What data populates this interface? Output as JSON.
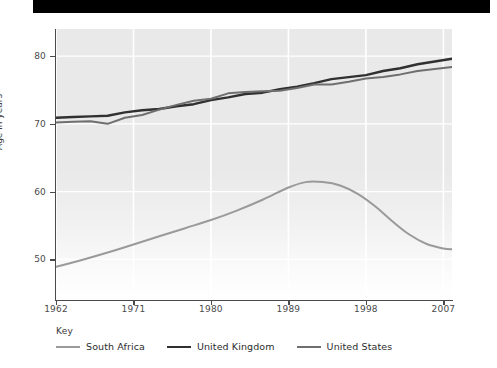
{
  "chart_data": {
    "type": "line",
    "title": "",
    "xlabel": "",
    "ylabel": "Age in years",
    "xlim": [
      1962,
      2008
    ],
    "ylim": [
      44,
      84
    ],
    "xticks": [
      1962,
      1971,
      1980,
      1989,
      1998,
      2007
    ],
    "yticks": [
      50,
      60,
      70,
      80
    ],
    "grid": true,
    "legend_position": "bottom-left",
    "legend_title": "Key",
    "series": [
      {
        "name": "South Africa",
        "color": "#9a9a9a",
        "x": [
          1962,
          1965,
          1968,
          1971,
          1974,
          1977,
          1980,
          1983,
          1986,
          1989,
          1991,
          1993,
          1995,
          1997,
          1999,
          2001,
          2003,
          2005,
          2007,
          2008
        ],
        "values": [
          48.9,
          49.9,
          51.0,
          52.2,
          53.4,
          54.6,
          55.8,
          57.2,
          58.8,
          60.6,
          61.4,
          61.4,
          60.9,
          59.7,
          57.9,
          55.7,
          53.7,
          52.3,
          51.6,
          51.5
        ]
      },
      {
        "name": "United Kingdom",
        "color": "#303030",
        "x": [
          1962,
          1964,
          1966,
          1968,
          1970,
          1972,
          1974,
          1976,
          1978,
          1980,
          1982,
          1984,
          1986,
          1988,
          1990,
          1992,
          1994,
          1996,
          1998,
          2000,
          2002,
          2004,
          2006,
          2008
        ],
        "values": [
          70.9,
          71.0,
          71.1,
          71.2,
          71.7,
          72.0,
          72.2,
          72.6,
          72.9,
          73.5,
          73.9,
          74.4,
          74.6,
          75.1,
          75.5,
          76.0,
          76.6,
          76.9,
          77.2,
          77.8,
          78.2,
          78.8,
          79.2,
          79.6
        ]
      },
      {
        "name": "United States",
        "color": "#6f6f6f",
        "x": [
          1962,
          1964,
          1966,
          1968,
          1970,
          1972,
          1974,
          1976,
          1978,
          1980,
          1982,
          1984,
          1986,
          1988,
          1990,
          1992,
          1994,
          1996,
          1998,
          2000,
          2002,
          2004,
          2006,
          2008
        ],
        "values": [
          70.2,
          70.3,
          70.4,
          70.0,
          70.9,
          71.3,
          72.1,
          72.8,
          73.4,
          73.7,
          74.5,
          74.7,
          74.8,
          74.9,
          75.3,
          75.8,
          75.8,
          76.2,
          76.7,
          76.9,
          77.3,
          77.8,
          78.1,
          78.4
        ]
      }
    ]
  },
  "axes": {
    "ylabel_text": "Age in years",
    "ytick_labels": [
      "50",
      "60",
      "70",
      "80"
    ],
    "xtick_labels": [
      "1962",
      "1971",
      "1980",
      "1989",
      "1998",
      "2007"
    ]
  },
  "legend": {
    "title": "Key",
    "entries": [
      {
        "label": "South Africa",
        "color": "#9a9a9a",
        "width": "2.2px"
      },
      {
        "label": "United Kingdom",
        "color": "#303030",
        "width": "2.6px"
      },
      {
        "label": "United States",
        "color": "#6f6f6f",
        "width": "2.4px"
      }
    ]
  }
}
